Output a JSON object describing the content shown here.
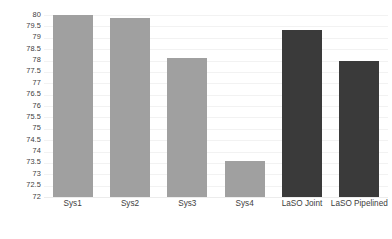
{
  "chart_data": {
    "type": "bar",
    "title": "",
    "subtitle": "",
    "xlabel": "",
    "ylabel": "",
    "categories": [
      "Sys1",
      "Sys2",
      "Sys3",
      "Sys4",
      "LaSO Joint",
      "LaSO Pipelined"
    ],
    "values": [
      80.0,
      79.85,
      78.1,
      73.55,
      79.3,
      77.95
    ],
    "series": [
      {
        "name": "Systems",
        "values": [
          80.0,
          79.85,
          78.1,
          73.55,
          79.3,
          77.95
        ]
      }
    ],
    "ylim": [
      72,
      80
    ],
    "ytick_step": 0.5,
    "yticks": [
      "80",
      "79.5",
      "79",
      "78.5",
      "78",
      "77.5",
      "77",
      "76.5",
      "76",
      "75.5",
      "75",
      "74.5",
      "74",
      "73.5",
      "73",
      "72.5",
      "72"
    ],
    "grid": true,
    "grid_axis": "y",
    "legend": false,
    "legend_position": "none",
    "bar_colors": [
      "#a0a0a0",
      "#a0a0a0",
      "#a0a0a0",
      "#a0a0a0",
      "#3a3a3a",
      "#3a3a3a"
    ],
    "colors": {
      "bar_light": "#a0a0a0",
      "bar_dark": "#3a3a3a",
      "gridline": "#f2f2f2",
      "axis_text": "#404040",
      "background": "#ffffff"
    }
  }
}
